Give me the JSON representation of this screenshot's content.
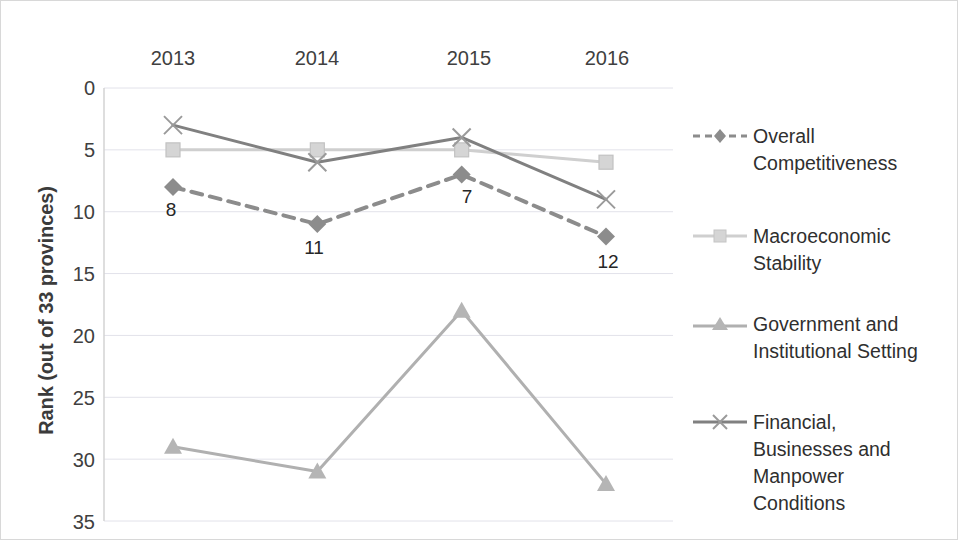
{
  "chart_data": {
    "type": "line",
    "title": "",
    "xlabel": "",
    "ylabel": "Rank (out of 33 provinces)",
    "categories": [
      "2013",
      "2014",
      "2015",
      "2016"
    ],
    "x_tick_labels": [
      "2013",
      "2014",
      "2015",
      "2016"
    ],
    "x_axis_position": "top",
    "y_tick_labels": [
      "0",
      "5",
      "10",
      "15",
      "20",
      "25",
      "30",
      "35"
    ],
    "y_ticks": [
      0,
      5,
      10,
      15,
      20,
      25,
      30,
      35
    ],
    "ylim": [
      0,
      35
    ],
    "y_inverted": true,
    "grid": true,
    "grid_axis": "y",
    "legend_position": "right",
    "series": [
      {
        "name": "Overall Competitiveness",
        "values": [
          8,
          11,
          7,
          12
        ],
        "marker": "diamond",
        "line_style": "dashed",
        "color": "#8c8c8c",
        "data_labels": [
          "8",
          "11",
          "7",
          "12"
        ]
      },
      {
        "name": "Macroeconomic Stability",
        "values": [
          5,
          5,
          5,
          6
        ],
        "marker": "square",
        "line_style": "solid",
        "color": "#cfcfcf",
        "data_labels": []
      },
      {
        "name": "Government and Institutional Setting",
        "values": [
          29,
          31,
          18,
          32
        ],
        "marker": "triangle",
        "line_style": "solid",
        "color": "#b0b0b0",
        "data_labels": []
      },
      {
        "name": "Financial, Businesses and Manpower Conditions",
        "values": [
          3,
          6,
          4,
          9
        ],
        "marker": "x",
        "line_style": "solid",
        "color": "#808080",
        "data_labels": []
      }
    ]
  },
  "legend": {
    "entries": [
      {
        "label_line_1": "Overall",
        "label_line_2": "Competitiveness",
        "label_line_3": "",
        "label_line_4": ""
      },
      {
        "label_line_1": "Macroeconomic",
        "label_line_2": "Stability",
        "label_line_3": "",
        "label_line_4": ""
      },
      {
        "label_line_1": "Government and",
        "label_line_2": "Institutional Setting",
        "label_line_3": "",
        "label_line_4": ""
      },
      {
        "label_line_1": "Financial,",
        "label_line_2": "Businesses and",
        "label_line_3": "Manpower",
        "label_line_4": "Conditions"
      }
    ]
  },
  "colors": {
    "overall": "#8c8c8c",
    "macro": "#cfcfcf",
    "government": "#b0b0b0",
    "financial": "#808080",
    "grid": "#e2e2ea",
    "axis": "#d3d3d3",
    "text": "#404040"
  }
}
